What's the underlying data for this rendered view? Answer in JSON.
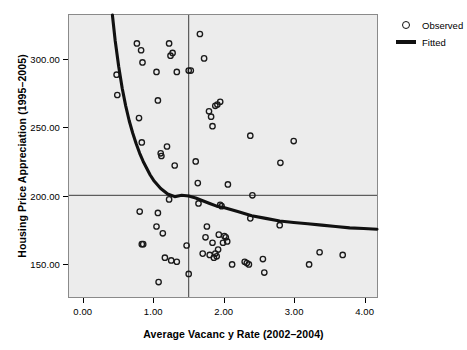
{
  "chart_data": {
    "type": "scatter",
    "title": "",
    "xlabel": "Average Vacanc y Rate (2002–2004)",
    "ylabel": "Housing Price Appreciation (1995–2005)",
    "xlim": [
      -0.21,
      4.19
    ],
    "ylim": [
      125.0,
      333.0
    ],
    "xticks": [
      0.0,
      1.0,
      2.0,
      3.0,
      4.0
    ],
    "xtick_labels": [
      "0.00",
      "1.00",
      "2.00",
      "3.00",
      "4.00"
    ],
    "yticks": [
      150.0,
      200.0,
      250.0,
      300.0
    ],
    "ytick_labels": [
      "150.00",
      "200.00",
      "250.00",
      "300.00"
    ],
    "grid": false,
    "plot_background": "#ececec",
    "frame_color": "#8a8a8a",
    "marker_color": "#1a1a1a",
    "line_color": "#111111",
    "reference_lines": {
      "horizontal_y": 200.0,
      "vertical_x": 1.5,
      "color": "#3a3a3a"
    },
    "legend": {
      "position": "right",
      "entries": [
        {
          "label": "Observed",
          "marker": "open-circle"
        },
        {
          "label": "Fitted",
          "marker": "line"
        }
      ]
    },
    "series": [
      {
        "name": "Observed",
        "marker": "open-circle",
        "points": [
          [
            0.47,
            289.0
          ],
          [
            0.48,
            274.0
          ],
          [
            0.76,
            312.0
          ],
          [
            0.82,
            307.0
          ],
          [
            0.84,
            298.0
          ],
          [
            0.79,
            257.0
          ],
          [
            0.83,
            239.0
          ],
          [
            1.04,
            291.0
          ],
          [
            1.06,
            270.0
          ],
          [
            1.1,
            231.0
          ],
          [
            1.11,
            229.0
          ],
          [
            1.22,
            312.0
          ],
          [
            1.24,
            303.0
          ],
          [
            1.27,
            305.0
          ],
          [
            1.19,
            236.0
          ],
          [
            1.33,
            291.0
          ],
          [
            1.3,
            222.0
          ],
          [
            1.22,
            197.0
          ],
          [
            1.5,
            292.0
          ],
          [
            1.53,
            292.0
          ],
          [
            1.6,
            225.0
          ],
          [
            1.63,
            209.0
          ],
          [
            1.66,
            319.0
          ],
          [
            1.72,
            301.0
          ],
          [
            1.79,
            262.0
          ],
          [
            1.82,
            258.0
          ],
          [
            1.84,
            251.0
          ],
          [
            1.88,
            266.0
          ],
          [
            1.91,
            267.0
          ],
          [
            1.95,
            269.0
          ],
          [
            2.06,
            208.0
          ],
          [
            2.38,
            244.0
          ],
          [
            2.41,
            200.0
          ],
          [
            2.81,
            224.0
          ],
          [
            3.0,
            240.0
          ],
          [
            0.8,
            188.0
          ],
          [
            0.83,
            164.0
          ],
          [
            0.85,
            164.0
          ],
          [
            1.04,
            177.0
          ],
          [
            1.06,
            187.0
          ],
          [
            1.07,
            136.0
          ],
          [
            1.13,
            172.0
          ],
          [
            1.16,
            154.0
          ],
          [
            1.25,
            152.0
          ],
          [
            1.33,
            151.0
          ],
          [
            1.47,
            163.0
          ],
          [
            1.5,
            142.0
          ],
          [
            1.64,
            194.0
          ],
          [
            1.7,
            157.0
          ],
          [
            1.74,
            169.0
          ],
          [
            1.76,
            177.0
          ],
          [
            1.8,
            156.0
          ],
          [
            1.84,
            165.0
          ],
          [
            1.86,
            154.0
          ],
          [
            1.88,
            157.0
          ],
          [
            1.9,
            155.0
          ],
          [
            1.92,
            160.0
          ],
          [
            1.93,
            171.0
          ],
          [
            1.95,
            193.0
          ],
          [
            1.97,
            192.0
          ],
          [
            1.99,
            165.0
          ],
          [
            2.01,
            170.0
          ],
          [
            2.03,
            169.0
          ],
          [
            2.05,
            166.0
          ],
          [
            2.12,
            149.0
          ],
          [
            2.3,
            151.0
          ],
          [
            2.33,
            150.0
          ],
          [
            2.36,
            149.0
          ],
          [
            2.38,
            183.0
          ],
          [
            2.56,
            153.0
          ],
          [
            2.58,
            143.0
          ],
          [
            2.8,
            178.0
          ],
          [
            3.22,
            149.0
          ],
          [
            3.37,
            158.0
          ],
          [
            3.7,
            156.0
          ]
        ]
      },
      {
        "name": "Fitted",
        "type": "line",
        "form": "power",
        "points": [
          [
            0.41,
            333.0
          ],
          [
            0.45,
            314.0
          ],
          [
            0.5,
            295.0
          ],
          [
            0.55,
            279.0
          ],
          [
            0.6,
            266.0
          ],
          [
            0.65,
            255.0
          ],
          [
            0.7,
            246.0
          ],
          [
            0.75,
            238.0
          ],
          [
            0.8,
            231.0
          ],
          [
            0.85,
            225.0
          ],
          [
            0.9,
            220.0
          ],
          [
            0.95,
            215.0
          ],
          [
            1.0,
            211.0
          ],
          [
            1.1,
            205.0
          ],
          [
            1.2,
            201.0
          ],
          [
            1.3,
            199.0
          ],
          [
            1.4,
            200.0
          ],
          [
            1.5,
            199.5
          ],
          [
            1.6,
            198.0
          ],
          [
            1.7,
            196.0
          ],
          [
            1.8,
            194.0
          ],
          [
            1.9,
            192.0
          ],
          [
            2.0,
            191.0
          ],
          [
            2.2,
            188.0
          ],
          [
            2.4,
            185.0
          ],
          [
            2.6,
            183.0
          ],
          [
            2.8,
            181.0
          ],
          [
            3.0,
            180.0
          ],
          [
            3.2,
            179.0
          ],
          [
            3.4,
            178.0
          ],
          [
            3.6,
            177.0
          ],
          [
            3.8,
            176.0
          ],
          [
            4.0,
            175.5
          ],
          [
            4.19,
            175.0
          ]
        ]
      }
    ]
  }
}
